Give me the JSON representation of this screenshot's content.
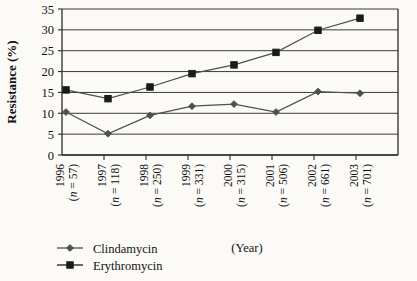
{
  "chart_data": {
    "type": "line",
    "title": "",
    "xlabel": "(Year)",
    "ylabel": "Resistance (%)",
    "ylim": [
      0,
      35
    ],
    "ytick_labels": [
      "0",
      "5",
      "10",
      "15",
      "20",
      "25",
      "30",
      "35"
    ],
    "ytick_values": [
      0,
      5,
      10,
      15,
      20,
      25,
      30,
      35
    ],
    "grid": true,
    "legend_position": "bottom-left",
    "categories": [
      "1996\n(n = 57)",
      "1997\n(n = 118)",
      "1998\n(n = 250)",
      "1999\n(n = 331)",
      "2000\n(n = 315)",
      "2001\n(n = 506)",
      "2002\n(n = 661)",
      "2003\n(n = 701)"
    ],
    "category_years": [
      "1996",
      "1997",
      "1998",
      "1999",
      "2000",
      "2001",
      "2002",
      "2003"
    ],
    "category_n": [
      "(n = 57)",
      "(n = 118)",
      "(n = 250)",
      "(n = 331)",
      "(n = 315)",
      "(n = 506)",
      "(n = 661)",
      "(n = 701)"
    ],
    "series": [
      {
        "name": "Clindamycin",
        "marker": "diamond",
        "color": "#4f4f4f",
        "values": [
          10.3,
          5.1,
          9.5,
          11.7,
          12.2,
          10.3,
          15.2,
          14.8
        ]
      },
      {
        "name": "Erythromycin",
        "marker": "square",
        "color": "#1a1a1a",
        "values": [
          15.6,
          13.5,
          16.3,
          19.5,
          21.6,
          24.6,
          29.9,
          32.8
        ]
      }
    ]
  },
  "legend": {
    "items": [
      {
        "label": "Clindamycin"
      },
      {
        "label": "Erythromycin"
      }
    ]
  },
  "axes": {
    "y_title": "Resistance (%)",
    "x_title": "(Year)"
  }
}
